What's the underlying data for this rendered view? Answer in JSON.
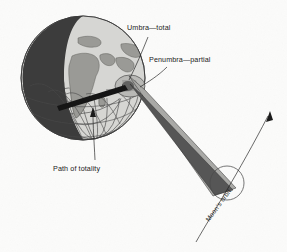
{
  "figure": {
    "background_color": "#fbfbfa"
  },
  "labels": {
    "umbra": "Umbra—total",
    "penumbra": "Penumbra—partial",
    "path_of_totality": "Path of totality",
    "moons_orbit": "Moon's orbit"
  },
  "elements": {
    "earth_name": "Earth globe",
    "moon_name": "Moon",
    "umbra_cone_name": "Umbra shadow cone",
    "penumbra_cone_name": "Penumbra shadow cone",
    "totality_bar_name": "Path of totality band",
    "orbit_arc_name": "Moon's orbital path arc"
  },
  "colors": {
    "night_side": "#3c3c3c",
    "day_side": "#d5d5d2",
    "land": "#9a9a96",
    "umbra": "#565656",
    "penumbra": "#a9a9a6",
    "totality_bar": "#151515",
    "outline": "#3a3a3a",
    "background": "#fbfbfa"
  }
}
